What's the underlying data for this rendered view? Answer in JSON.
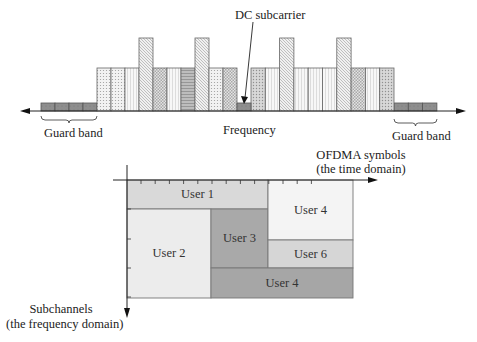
{
  "top_diagram": {
    "dc_label": "DC subcarrier",
    "frequency_label": "Frequency",
    "guard_left_label": "Guard band",
    "guard_right_label": "Guard band",
    "axis_y": 111,
    "guard_left": {
      "x": 41,
      "cells": 4,
      "cell_width": 14,
      "top": 103
    },
    "guard_right": {
      "x": 394,
      "cells": 3,
      "cell_width": 14.3,
      "top": 103
    },
    "dc": {
      "x": 237,
      "width": 14,
      "top": 103
    },
    "bars_left": {
      "x": 97,
      "width": 14,
      "normal_top": 68,
      "tall_top": 38,
      "patterns": [
        "dots",
        "dots",
        "vlines",
        "diag-tall",
        "check",
        "vlines",
        "hlines",
        "diag-tall",
        "dots",
        "check"
      ]
    },
    "bars_right": {
      "x": 251,
      "width": 14.3,
      "normal_top": 68,
      "tall_top": 38,
      "patterns": [
        "grid",
        "vlines",
        "diag-tall",
        "vlines",
        "vlines",
        "vlines",
        "diag-tall",
        "check",
        "vlines",
        "grid"
      ]
    }
  },
  "bottom_diagram": {
    "x_axis_label_line1": "OFDMA symbols",
    "x_axis_label_line2": "(the time domain)",
    "y_axis_label_line1": "Subchannels",
    "y_axis_label_line2": "(the frequency domain)",
    "blocks": [
      {
        "label": "User 1",
        "x": 127,
        "y": 180,
        "w": 141,
        "h": 29,
        "fill": "#d9d9d9"
      },
      {
        "label": "User 2",
        "x": 127,
        "y": 209,
        "w": 84,
        "h": 89,
        "fill": "#ececec"
      },
      {
        "label": "User 3",
        "x": 211,
        "y": 209,
        "w": 57,
        "h": 59,
        "fill": "#a9a9a9"
      },
      {
        "label": "User 4",
        "x": 268,
        "y": 180,
        "w": 85,
        "h": 60,
        "fill": "#f4f4f4"
      },
      {
        "label": "User 6",
        "x": 268,
        "y": 240,
        "w": 85,
        "h": 28,
        "fill": "#d6d6d6"
      },
      {
        "label": "User 4",
        "x": 211,
        "y": 268,
        "w": 142,
        "h": 30,
        "fill": "#a6a6a6"
      }
    ]
  }
}
